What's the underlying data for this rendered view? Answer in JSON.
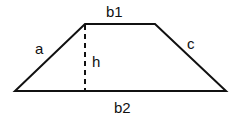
{
  "diagram": {
    "colors": {
      "stroke": "#111111",
      "background": "#ffffff"
    },
    "vertices": {
      "top_left": [
        85,
        24
      ],
      "top_right": [
        155,
        24
      ],
      "bottom_right": [
        226,
        91
      ],
      "bottom_left": [
        15,
        91
      ]
    },
    "labels": {
      "top_base": "b1",
      "bottom_base": "b2",
      "left_side": "a",
      "right_side": "c",
      "height": "h"
    }
  }
}
